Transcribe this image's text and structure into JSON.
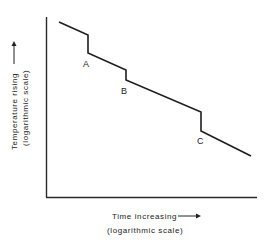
{
  "chart_data": {
    "type": "line",
    "title": "",
    "xlabel": "Time increasing",
    "xlabel_sub": "(logarithmic scale)",
    "ylabel": "Temperature rising",
    "ylabel_sub": "(logarithmic scale)",
    "x_scale": "log",
    "y_scale": "log",
    "grid": false,
    "legend": null,
    "ticks": "none",
    "series": [
      {
        "name": "curve",
        "points_px": [
          [
            59,
            22
          ],
          [
            88,
            35
          ],
          [
            88,
            53
          ],
          [
            126,
            70
          ],
          [
            126,
            80
          ],
          [
            201,
            112
          ],
          [
            201,
            131
          ],
          [
            251,
            156
          ]
        ]
      }
    ],
    "annotations": [
      {
        "text": "A",
        "x_px": 86,
        "y_px": 64
      },
      {
        "text": "B",
        "x_px": 124,
        "y_px": 91
      },
      {
        "text": "C",
        "x_px": 200,
        "y_px": 141
      }
    ]
  },
  "axes": {
    "y_arrow": "arrow-up",
    "x_arrow": "arrow-right"
  }
}
